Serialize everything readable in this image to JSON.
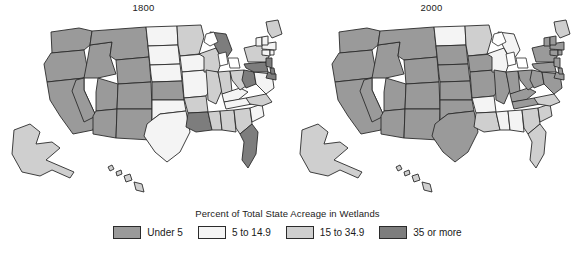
{
  "figure": {
    "kind": "choropleth-map-pair",
    "background": "#ffffff"
  },
  "maps": [
    {
      "id": "map-1800",
      "title": "1800"
    },
    {
      "id": "map-2000",
      "title": "2000"
    }
  ],
  "legend": {
    "title": "Percent of Total State Acreage in Wetlands",
    "items": [
      {
        "label": "Under 5",
        "color": "#9a9a9a"
      },
      {
        "label": "5 to 14.9",
        "color": "#f4f4f4"
      },
      {
        "label": "15 to 34.9",
        "color": "#cfcfcf"
      },
      {
        "label": "35 or more",
        "color": "#7d7d7d"
      }
    ]
  },
  "chart_data": {
    "type": "choropleth",
    "title": "Percent of Total State Acreage in Wetlands",
    "panels": [
      "1800",
      "2000"
    ],
    "categories": [
      "Under 5",
      "5 to 14.9",
      "15 to 34.9",
      "35 or more"
    ],
    "category_colors": [
      "#9a9a9a",
      "#f4f4f4",
      "#cfcfcf",
      "#7d7d7d"
    ],
    "legend_position": "bottom",
    "grid": false,
    "values_1800": {
      "WA": "Under 5",
      "OR": "Under 5",
      "CA": "Under 5",
      "NV": "Under 5",
      "ID": "Under 5",
      "MT": "Under 5",
      "WY": "Under 5",
      "UT": "Under 5",
      "AZ": "Under 5",
      "CO": "Under 5",
      "NM": "Under 5",
      "ND": "5 to 14.9",
      "SD": "5 to 14.9",
      "NE": "5 to 14.9",
      "KS": "Under 5",
      "OK": "5 to 14.9",
      "TX": "5 to 14.9",
      "MN": "15 to 34.9",
      "IA": "5 to 14.9",
      "MO": "5 to 14.9",
      "AR": "15 to 34.9",
      "LA": "35 or more",
      "WI": "15 to 34.9",
      "IL": "15 to 34.9",
      "MS": "15 to 34.9",
      "MI": "35 or more",
      "IN": "15 to 34.9",
      "KY": "5 to 14.9",
      "TN": "5 to 14.9",
      "AL": "15 to 34.9",
      "OH": "15 to 34.9",
      "WV": "35 or more",
      "GA": "15 to 34.9",
      "FL": "35 or more",
      "SC": "5 to 14.9",
      "NC": "15 to 34.9",
      "VA": "5 to 14.9",
      "PA": "35 or more",
      "NY": "15 to 34.9",
      "MD": "35 or more",
      "DE": "35 or more",
      "NJ": "35 or more",
      "CT": "5 to 14.9",
      "RI": "5 to 14.9",
      "MA": "5 to 14.9",
      "VT": "5 to 14.9",
      "NH": "5 to 14.9",
      "ME": "15 to 34.9",
      "AK": "15 to 34.9",
      "HI": "15 to 34.9"
    },
    "values_2000": {
      "WA": "Under 5",
      "OR": "Under 5",
      "CA": "Under 5",
      "NV": "Under 5",
      "ID": "Under 5",
      "MT": "Under 5",
      "WY": "Under 5",
      "UT": "Under 5",
      "AZ": "Under 5",
      "CO": "Under 5",
      "NM": "Under 5",
      "ND": "5 to 14.9",
      "SD": "Under 5",
      "NE": "Under 5",
      "KS": "Under 5",
      "OK": "Under 5",
      "TX": "Under 5",
      "MN": "15 to 34.9",
      "IA": "Under 5",
      "MO": "Under 5",
      "AR": "5 to 14.9",
      "LA": "15 to 34.9",
      "WI": "5 to 14.9",
      "IL": "Under 5",
      "MS": "5 to 14.9",
      "MI": "5 to 14.9",
      "IN": "Under 5",
      "KY": "Under 5",
      "TN": "Under 5",
      "AL": "5 to 14.9",
      "OH": "Under 5",
      "WV": "Under 5",
      "GA": "15 to 34.9",
      "FL": "15 to 34.9",
      "SC": "15 to 34.9",
      "NC": "15 to 34.9",
      "VA": "Under 5",
      "PA": "Under 5",
      "NY": "Under 5",
      "MD": "Under 5",
      "DE": "Under 5",
      "NJ": "Under 5",
      "CT": "Under 5",
      "RI": "Under 5",
      "MA": "Under 5",
      "VT": "Under 5",
      "NH": "Under 5",
      "ME": "15 to 34.9",
      "AK": "15 to 34.9",
      "HI": "15 to 34.9"
    }
  }
}
